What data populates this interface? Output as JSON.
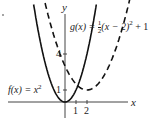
{
  "figure_marker": ".",
  "chart_data": {
    "type": "line",
    "title": "",
    "xlabel": "x",
    "ylabel": "y",
    "x_ticks": [
      "1",
      "2"
    ],
    "y_ticks": [
      "1",
      "4"
    ],
    "grid": false,
    "series": [
      {
        "name": "f(x) = x²",
        "style": "solid",
        "equation": "x^2",
        "x": [
          -2.5,
          -2,
          -1,
          0,
          1,
          2,
          2.5
        ],
        "y": [
          6.25,
          4,
          1,
          0,
          1,
          4,
          6.25
        ]
      },
      {
        "name": "g(x) = ½(x − 2)² + 1",
        "style": "dashed",
        "equation": "0.5*(x-2)^2+1",
        "x": [
          -2,
          -1,
          0,
          1,
          2,
          3,
          4,
          5,
          6.5
        ],
        "y": [
          9,
          5.5,
          3,
          1.5,
          1,
          1.5,
          3,
          5.5,
          11.1
        ]
      }
    ],
    "annotations": [
      {
        "text": "f(x) = x²",
        "near": "left branch of f"
      },
      {
        "text": "g(x) = ½(x − 2)² + 1",
        "near": "top right"
      }
    ]
  },
  "labels": {
    "f": "f(x) = x",
    "f_sup": "2",
    "g_pre": "g(x) = ",
    "g_num": "1",
    "g_den": "2",
    "g_post": "(x − 2)",
    "g_sup": "2",
    "g_end": " + 1",
    "x_axis": "x",
    "y_axis": "y",
    "tick_x1": "1",
    "tick_x2": "2",
    "tick_y1": "1",
    "tick_y4": "4"
  }
}
